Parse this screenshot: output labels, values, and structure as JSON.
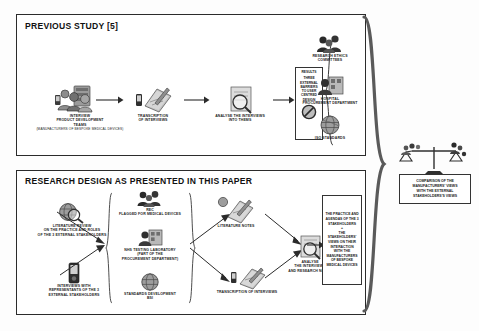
{
  "figure": {
    "background": "#ffffff",
    "line_color": "#2b2b2b"
  },
  "previous_study": {
    "title": "PREVIOUS STUDY [5]",
    "steps": [
      {
        "icon": "people-group-icon",
        "label": "INTERVIEW\nPRODUCT DEVELOPMENT\nTEAMS",
        "subnote": "(manufacturers of bespoke medical devices)"
      },
      {
        "icon": "notepad-pen-icon",
        "label": "TRANSCRIPTION\nOF INTERVIEWS"
      },
      {
        "icon": "magnifier-doc-icon",
        "label": "ANALYSE THE INTERVIEWS\nINTO THEMS"
      }
    ],
    "results_box": {
      "heading": "RESULTS",
      "body": "THREE\nEXTERNAL\nBARRIERS\nTO USER\nCENTRED\nDESIGN",
      "icon": "prohibition-icon"
    },
    "stakeholders": [
      {
        "icon": "committee-people-icon",
        "label": "RESEARCH ETHICS\nCOMMITTEES"
      },
      {
        "icon": "worker-building-icon",
        "label": "HOSPITAL\nPROCUREMENT DEPARTMENT"
      },
      {
        "icon": "globe-icon",
        "label": "ISO STANDARDS"
      }
    ]
  },
  "research_design": {
    "title": "RESEARCH DESIGN AS PRESENTED IN THIS PAPER",
    "inputs": [
      {
        "icon": "globe-magnifier-icon",
        "label": "LITERATURE REVIEW\nON THE PRACTICE AND ROLES\nOF THE 3 EXTERNAL STAKEHOLDERS"
      },
      {
        "icon": "recorder-icon",
        "label": "INTERVIEWS WITH\nREPRESENTANTS OF THE 3\nEXTERNAL STAKEHOLDERS"
      }
    ],
    "stakeholders": [
      {
        "icon": "committee-people-icon",
        "label": "REC\nFLAGGED FOR MEDICAL DEVICES"
      },
      {
        "icon": "worker-building-icon",
        "label": "NHS TESTING LABORATORY\n(PART OF THE\nPROCUREMENT DEPARTMENT)"
      },
      {
        "icon": "globe-icon",
        "label": "STANDARDS DEVELOPMENT\nBSI"
      }
    ],
    "outputs": [
      {
        "icon": "notepad-globe-icon",
        "label": "LITERATURE NOTES"
      },
      {
        "icon": "notepad-pen-icon",
        "label": "TRANSCRIPTION OF INTERVIEWS"
      }
    ],
    "analysis": {
      "icon": "magnifier-doc-icon",
      "label": "ANALYSE\nTHE INTERVIEWS\nAND RESEARCH NOTES"
    },
    "findings_box": {
      "text": "THE PRACTICE AND\nAGENDAS OF THE 3\nSTAKEHOLDERS\n+\nTHE\nSTAKEHOLDERS'\nVIEWS ON THEIR\nINTERACTION\nWITH THE\nMANUFACTURERS\nOF  BESPOKE\nMEDICAL DEVICES"
    }
  },
  "comparison": {
    "icon": "balance-scales-icon",
    "text": "COMPARISON OF THE\nMANUFACTURERS' VIEWS\nWITH THE EXTERNAL\nSTAKEHOLDERS'S VIEWS"
  }
}
